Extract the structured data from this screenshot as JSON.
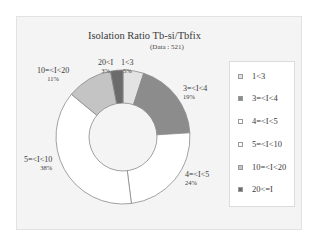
{
  "chart_data": {
    "type": "pie",
    "variant": "donut",
    "title": "Isolation Ratio Tb-si/Tbfix",
    "subtitle": "(Data : 521)",
    "categories": [
      "1<3",
      "3=<I<4",
      "4=<I<5",
      "5=<I<10",
      "10=<I<20",
      "20<I"
    ],
    "values": [
      5,
      19,
      24,
      38,
      11,
      3
    ],
    "unit": "%",
    "legend_labels": [
      "1<3",
      "3=<I<4",
      "4=<I<5",
      "5=<I<10",
      "10=<I<20",
      "20<=I"
    ],
    "legend_position": "right",
    "colors": [
      "#e3e3e3",
      "#8c8c8c",
      "#ffffff",
      "#ffffff",
      "#c4c4c4",
      "#6b6b6b"
    ],
    "start_angle": "12 o'clock",
    "direction": "clockwise"
  },
  "labels": [
    {
      "name": "1<3",
      "pct": "5%"
    },
    {
      "name": "3=<I<4",
      "pct": "19%"
    },
    {
      "name": "4=<I<5",
      "pct": "24%"
    },
    {
      "name": "5=<I<10",
      "pct": "38%"
    },
    {
      "name": "10=<I<20",
      "pct": "11%"
    },
    {
      "name": "20<I",
      "pct": "3%"
    }
  ]
}
